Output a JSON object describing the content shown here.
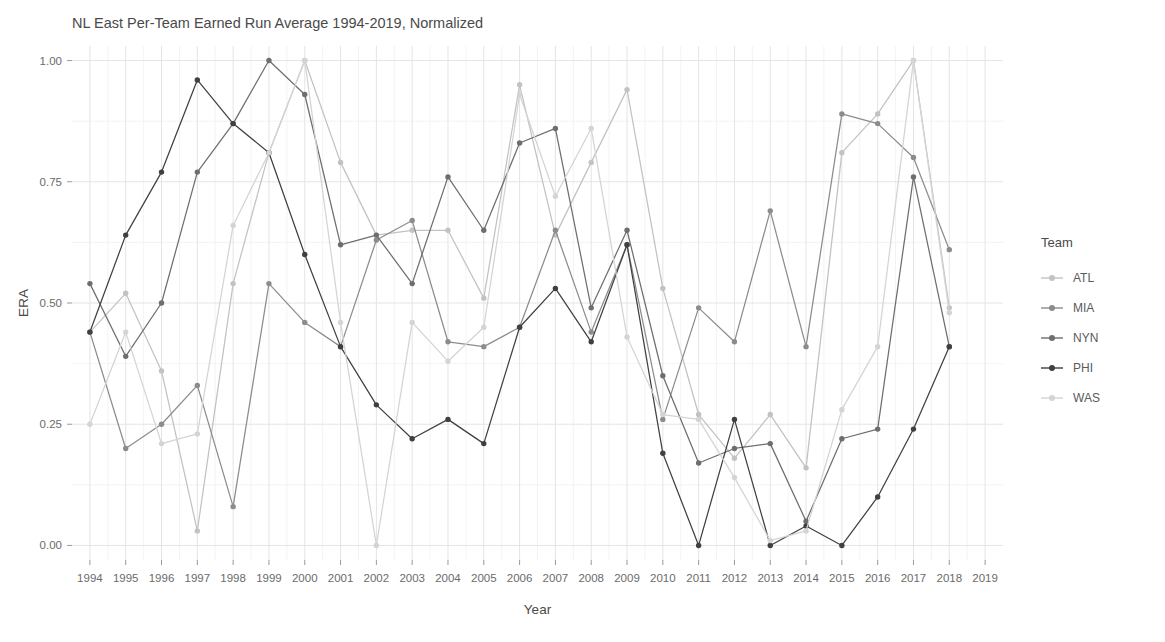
{
  "chart_data": {
    "type": "line",
    "title": "NL East Per-Team Earned Run Average 1994-2019, Normalized",
    "xlabel": "Year",
    "ylabel": "ERA",
    "grid": true,
    "legend_position": "right",
    "legend_title": "Team",
    "xlim": [
      1993.5,
      2019.5
    ],
    "ylim": [
      -0.03,
      1.03
    ],
    "xticks": [
      1994,
      1995,
      1996,
      1997,
      1998,
      1999,
      2000,
      2001,
      2002,
      2003,
      2004,
      2005,
      2006,
      2007,
      2008,
      2009,
      2010,
      2011,
      2012,
      2013,
      2014,
      2015,
      2016,
      2017,
      2018,
      2019
    ],
    "xtick_labels": [
      "1994",
      "1995",
      "1996",
      "1997",
      "1998",
      "1999",
      "2000",
      "2001",
      "2002",
      "2003",
      "2004",
      "2005",
      "2006",
      "2007",
      "2008",
      "2009",
      "2010",
      "2011",
      "2012",
      "2013",
      "2014",
      "2015",
      "2016",
      "2017",
      "2018",
      "2019"
    ],
    "yticks": [
      0.0,
      0.25,
      0.5,
      0.75,
      1.0
    ],
    "ytick_labels": [
      "0.00",
      "0.25",
      "0.50",
      "0.75",
      "1.00"
    ],
    "x": [
      1994,
      1995,
      1996,
      1997,
      1998,
      1999,
      2000,
      2001,
      2002,
      2003,
      2004,
      2005,
      2006,
      2007,
      2008,
      2009,
      2010,
      2011,
      2012,
      2013,
      2014,
      2015,
      2016,
      2017,
      2018
    ],
    "series": [
      {
        "name": "ATL",
        "color": "#c2c2c2",
        "values": [
          0.44,
          0.52,
          0.36,
          0.03,
          0.54,
          0.81,
          1.0,
          0.79,
          0.64,
          0.65,
          0.65,
          0.51,
          0.95,
          0.64,
          0.79,
          0.94,
          0.53,
          0.27,
          0.18,
          0.27,
          0.16,
          0.81,
          0.89,
          1.0,
          0.49
        ]
      },
      {
        "name": "MIA",
        "color": "#8c8c8c",
        "values": [
          0.44,
          0.2,
          0.25,
          0.33,
          0.08,
          0.54,
          0.46,
          0.41,
          0.63,
          0.67,
          0.42,
          0.41,
          0.45,
          0.65,
          0.44,
          0.62,
          0.26,
          0.49,
          0.42,
          0.69,
          0.41,
          0.89,
          0.87,
          0.8,
          0.61
        ]
      },
      {
        "name": "NYN",
        "color": "#6e6e6e",
        "values": [
          0.54,
          0.39,
          0.5,
          0.77,
          0.87,
          1.0,
          0.93,
          0.62,
          0.64,
          0.54,
          0.76,
          0.65,
          0.83,
          0.86,
          0.49,
          0.65,
          0.35,
          0.17,
          0.2,
          0.21,
          0.05,
          0.22,
          0.24,
          0.76,
          0.41
        ]
      },
      {
        "name": "PHI",
        "color": "#404040",
        "values": [
          0.44,
          0.64,
          0.77,
          0.96,
          0.87,
          0.81,
          0.6,
          0.41,
          0.29,
          0.22,
          0.26,
          0.21,
          0.45,
          0.53,
          0.42,
          0.62,
          0.19,
          0.0,
          0.26,
          0.0,
          0.04,
          0.0,
          0.1,
          0.24,
          0.41
        ]
      },
      {
        "name": "WAS",
        "color": "#d4d4d4",
        "values": [
          0.25,
          0.44,
          0.21,
          0.23,
          0.66,
          0.81,
          1.0,
          0.46,
          0.0,
          0.46,
          0.38,
          0.45,
          0.93,
          0.72,
          0.86,
          0.43,
          0.27,
          0.26,
          0.14,
          0.01,
          0.03,
          0.28,
          0.41,
          1.0,
          0.48
        ]
      }
    ]
  },
  "legend": {
    "title": "Team",
    "entries": [
      {
        "label": "ATL",
        "color": "#c2c2c2"
      },
      {
        "label": "MIA",
        "color": "#8c8c8c"
      },
      {
        "label": "NYN",
        "color": "#6e6e6e"
      },
      {
        "label": "PHI",
        "color": "#404040"
      },
      {
        "label": "WAS",
        "color": "#d4d4d4"
      }
    ]
  },
  "theme": {
    "background": "#ffffff",
    "panel": "#ffffff",
    "grid_major": "#e4e4e6",
    "grid_minor": "#f0f0f2",
    "text": "#4a4a4a",
    "tick_text": "#6b6b6b"
  }
}
